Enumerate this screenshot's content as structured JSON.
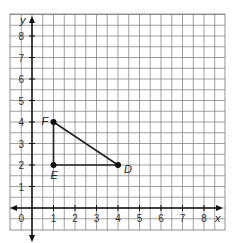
{
  "chart_data": {
    "type": "scatter",
    "title": "",
    "xlabel": "x",
    "ylabel": "y",
    "xlim": [
      -0.5,
      9
    ],
    "ylim": [
      -0.5,
      9
    ],
    "grid": true,
    "x_ticks": [
      "1",
      "2",
      "3",
      "4",
      "5",
      "6",
      "7",
      "8"
    ],
    "y_ticks": [
      "1",
      "2",
      "3",
      "4",
      "5",
      "6",
      "7",
      "8"
    ],
    "origin_label": "0",
    "points": [
      {
        "name": "D",
        "x": 4,
        "y": 2
      },
      {
        "name": "E",
        "x": 1,
        "y": 2
      },
      {
        "name": "F",
        "x": 1,
        "y": 4
      }
    ],
    "segments": [
      [
        "E",
        "D"
      ],
      [
        "E",
        "F"
      ],
      [
        "F",
        "D"
      ]
    ]
  }
}
